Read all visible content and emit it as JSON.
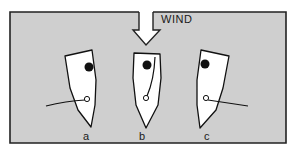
{
  "diagram": {
    "wind_label": "WIND",
    "colors": {
      "background": "#cfcfcf",
      "frame": "#222222",
      "boat_fill": "#ffffff",
      "ink": "#111111"
    },
    "wind_arrow": {
      "direction": "down",
      "shaft": {
        "x1": 139,
        "x2": 153,
        "y_top": 12,
        "y_bottom": 30
      },
      "head": {
        "x_left": 133,
        "x_right": 160,
        "y": 30,
        "tip_x": 146,
        "tip_y": 45
      }
    },
    "boats": [
      {
        "id": "a",
        "label": "a",
        "heading": "rotated-left",
        "hull_points": "65,56 92,50 96,80 95,105 91,127 78,110 70,88",
        "mast": {
          "cx": 89,
          "cy": 67,
          "r": 4.5
        },
        "tiller_pivot": {
          "cx": 87,
          "cy": 99,
          "r": 2.5
        },
        "tiller_line": "M46,106 Q66,101 85,100",
        "label_pos": {
          "x": 85,
          "y": 140
        }
      },
      {
        "id": "b",
        "label": "b",
        "heading": "straight",
        "hull_points": "134,53 160,54 161,78 158,105 146,128 136,105 133,78",
        "mast": {
          "cx": 147,
          "cy": 65,
          "r": 4.5
        },
        "tiller_pivot": {
          "cx": 146,
          "cy": 98,
          "r": 2.5
        },
        "tiller_line": "M155,57 Q154,80 147,96",
        "label_pos": {
          "x": 141,
          "y": 140
        }
      },
      {
        "id": "c",
        "label": "c",
        "heading": "rotated-right",
        "hull_points": "201,50 229,56 223,88 216,110 200,128 197,105 197,80",
        "mast": {
          "cx": 205,
          "cy": 64,
          "r": 4.5
        },
        "tiller_pivot": {
          "cx": 206,
          "cy": 98,
          "r": 2.5
        },
        "tiller_line": "M208,100 Q228,103 248,106",
        "label_pos": {
          "x": 206,
          "y": 140
        }
      }
    ]
  }
}
